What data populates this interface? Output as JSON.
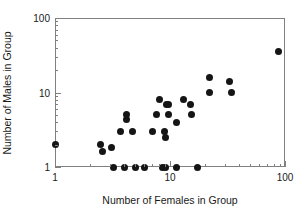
{
  "chart_data": {
    "type": "scatter",
    "title": "",
    "xlabel": "Number of Females in Group",
    "ylabel": "Number of Males in Group",
    "xscale": "log",
    "yscale": "log",
    "xlim": [
      1,
      100
    ],
    "ylim": [
      1,
      100
    ],
    "xticks": [
      1,
      10,
      100
    ],
    "xticklabels": [
      "1",
      "10",
      "100"
    ],
    "yticks": [
      1,
      10,
      100
    ],
    "yticklabels": [
      "1",
      "10",
      "100"
    ],
    "grid": false,
    "legend": null,
    "marker": "filled-circle",
    "marker_color": "#151515",
    "frame_color": "#808080",
    "points": [
      {
        "x": 1,
        "y": 2
      },
      {
        "x": 2.5,
        "y": 2
      },
      {
        "x": 2.6,
        "y": 1.6
      },
      {
        "x": 3.1,
        "y": 1.8
      },
      {
        "x": 3.2,
        "y": 1
      },
      {
        "x": 4.0,
        "y": 1
      },
      {
        "x": 5.0,
        "y": 1
      },
      {
        "x": 6.0,
        "y": 1
      },
      {
        "x": 8.6,
        "y": 1
      },
      {
        "x": 9.2,
        "y": 1
      },
      {
        "x": 11.5,
        "y": 1
      },
      {
        "x": 17.5,
        "y": 1
      },
      {
        "x": 3.7,
        "y": 3
      },
      {
        "x": 4.7,
        "y": 3
      },
      {
        "x": 7.0,
        "y": 3
      },
      {
        "x": 9.0,
        "y": 3
      },
      {
        "x": 9.2,
        "y": 2.5
      },
      {
        "x": 4.2,
        "y": 5
      },
      {
        "x": 4.2,
        "y": 4.3
      },
      {
        "x": 7.6,
        "y": 5
      },
      {
        "x": 9.8,
        "y": 5
      },
      {
        "x": 8.1,
        "y": 8
      },
      {
        "x": 9.3,
        "y": 7
      },
      {
        "x": 9.8,
        "y": 7
      },
      {
        "x": 11.5,
        "y": 4
      },
      {
        "x": 13.0,
        "y": 8
      },
      {
        "x": 15.0,
        "y": 7
      },
      {
        "x": 15.5,
        "y": 5
      },
      {
        "x": 22.0,
        "y": 16
      },
      {
        "x": 22.0,
        "y": 10
      },
      {
        "x": 33.0,
        "y": 14
      },
      {
        "x": 34.0,
        "y": 10
      },
      {
        "x": 88.0,
        "y": 35
      }
    ],
    "minor_x": [
      2,
      3,
      4,
      5,
      6,
      7,
      8,
      9,
      20,
      30,
      40,
      50,
      60,
      70,
      80,
      90
    ],
    "minor_y": [
      2,
      3,
      4,
      5,
      6,
      7,
      8,
      9,
      20,
      30,
      40,
      50,
      60,
      70,
      80,
      90
    ]
  }
}
